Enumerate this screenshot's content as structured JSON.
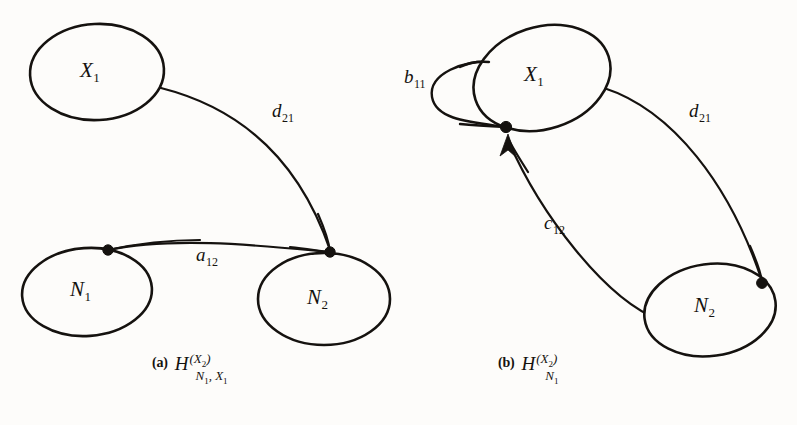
{
  "figure": {
    "background_color": "#fdfcfa",
    "ink_color": "#15120f",
    "panels": [
      {
        "id": "a",
        "caption_tag": "(a)",
        "caption_symbol": "H",
        "caption_superscript": "(X2)",
        "caption_subscript": "N1, X1",
        "nodes": [
          {
            "id": "X1",
            "label": "X",
            "sublabel": "1"
          },
          {
            "id": "N1",
            "label": "N",
            "sublabel": "1"
          },
          {
            "id": "N2",
            "label": "N",
            "sublabel": "2"
          }
        ],
        "edges": [
          {
            "id": "d21",
            "label": "d",
            "sublabel": "21",
            "from": "X1",
            "to": "N2",
            "directed": "false"
          },
          {
            "id": "a12",
            "label": "a",
            "sublabel": "12",
            "from": "N1",
            "to": "N2",
            "directed": "false"
          }
        ],
        "vertex_dots": 2
      },
      {
        "id": "b",
        "caption_tag": "(b)",
        "caption_symbol": "H",
        "caption_superscript": "(X2)",
        "caption_subscript": "N1",
        "nodes": [
          {
            "id": "X1",
            "label": "X",
            "sublabel": "1"
          },
          {
            "id": "N2",
            "label": "N",
            "sublabel": "2"
          }
        ],
        "edges": [
          {
            "id": "b11",
            "label": "b",
            "sublabel": "11",
            "from": "X1",
            "to": "X1",
            "directed": "false"
          },
          {
            "id": "d21",
            "label": "d",
            "sublabel": "21",
            "from": "X1",
            "to": "N2",
            "directed": "false"
          },
          {
            "id": "c12",
            "label": "c",
            "sublabel": "12",
            "from": "N2",
            "to": "X1",
            "directed": "true"
          }
        ],
        "vertex_dots": 2
      }
    ]
  },
  "geometry": {
    "panel_a": {
      "node_X1": {
        "cx": 97,
        "cy": 72,
        "rx": 67,
        "ry": 48,
        "rot": -3
      },
      "node_N1": {
        "cx": 87,
        "cy": 292,
        "rx": 65,
        "ry": 44,
        "rot": -4
      },
      "node_N2": {
        "cx": 324,
        "cy": 299,
        "rx": 66,
        "ry": 46,
        "rot": 0
      },
      "edge_d21": "M 161,88 C 248,110 302,168 330,250",
      "edge_a12": "M 108,250 C 176,236 264,246 330,252",
      "dot_N1": {
        "cx": 108,
        "cy": 250
      },
      "dot_N2": {
        "cx": 330,
        "cy": 252
      }
    },
    "panel_b": {
      "node_X1": {
        "cx": 542,
        "cy": 78,
        "rx": 70,
        "ry": 51,
        "rot": -18
      },
      "node_N2": {
        "cx": 710,
        "cy": 310,
        "rx": 66,
        "ry": 46,
        "rot": -8
      },
      "edge_b11": "M 506,127 C 470,122 436,120 432,97 C 428,73 466,60 489,62",
      "edge_d21": "M 604,88 C 672,110 730,184 762,281",
      "edge_c12": "M 660,320 C 606,300 540,214 508,140",
      "arrow_c12": "M 508,134 L 500,156 L 508,150 L 516,157 Z",
      "dot_X1": {
        "cx": 506,
        "cy": 127
      },
      "dot_N2": {
        "cx": 762,
        "cy": 283
      }
    },
    "labels": {
      "a_X1": {
        "x": 80,
        "y": 58
      },
      "a_N1": {
        "x": 70,
        "y": 277
      },
      "a_N2": {
        "x": 307,
        "y": 285
      },
      "a_d21": {
        "x": 272,
        "y": 100
      },
      "a_a12": {
        "x": 196,
        "y": 244
      },
      "b_X1": {
        "x": 524,
        "y": 62
      },
      "b_N2": {
        "x": 694,
        "y": 293
      },
      "b_b11": {
        "x": 404,
        "y": 66
      },
      "b_d21": {
        "x": 689,
        "y": 100
      },
      "b_c12": {
        "x": 544,
        "y": 212
      },
      "cap_a": {
        "x": 152,
        "y": 355
      },
      "cap_b": {
        "x": 498,
        "y": 355
      }
    }
  }
}
